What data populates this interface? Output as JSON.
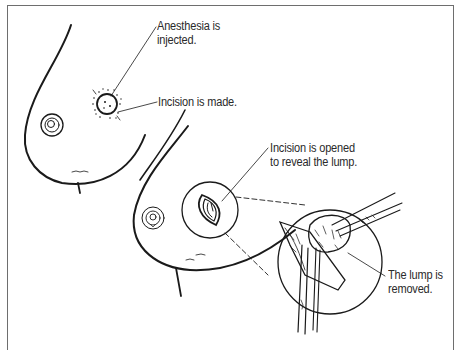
{
  "figure": {
    "labels": {
      "anesthesia": [
        "Anesthesia is",
        "injected."
      ],
      "incision_made": "Incision is made.",
      "incision_opened": [
        "Incision is opened",
        "to reveal the lump."
      ],
      "lump_removed": [
        "The lump is",
        "removed."
      ]
    },
    "colors": {
      "ink": "#1a1a1a",
      "frame": "#6e6e6e",
      "background": "#ffffff"
    }
  }
}
